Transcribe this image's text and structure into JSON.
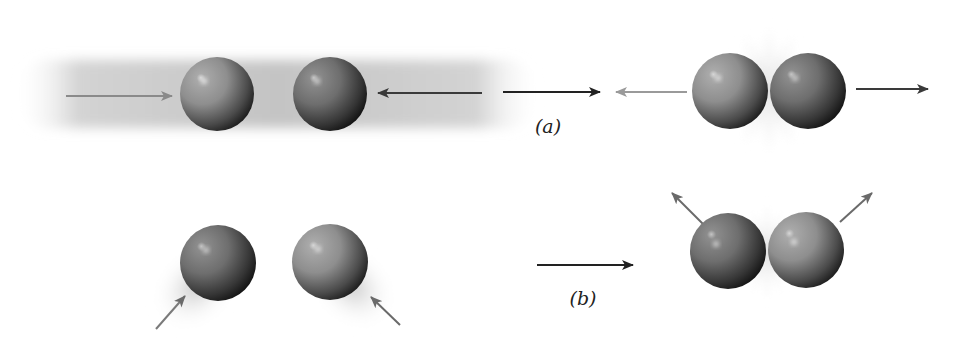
{
  "figure": {
    "panels": [
      {
        "id": "a",
        "label": "(a)",
        "label_pos": [
          548,
          126
        ],
        "description": "Head-on collision: two spheres approach along a line, collide, and move apart along the same line",
        "before": {
          "blur": {
            "x": 15,
            "y": 57,
            "w": 525,
            "h": 74
          },
          "spheres": [
            {
              "cx": 217,
              "cy": 94,
              "r": 37,
              "tone": "light"
            },
            {
              "cx": 330,
              "cy": 94,
              "r": 37,
              "tone": "dark"
            }
          ],
          "arrows": [
            {
              "x1": 66,
              "y1": 96,
              "x2": 172,
              "y2": 96,
              "color": "#8a8a8a",
              "name": "sphere-1-velocity-arrow"
            },
            {
              "x1": 482,
              "y1": 93,
              "x2": 378,
              "y2": 93,
              "color": "#3a3a3a",
              "name": "sphere-2-velocity-arrow"
            }
          ]
        },
        "transition_arrow": {
          "x1": 503,
          "y1": 92,
          "x2": 600,
          "y2": 92,
          "color": "#222222"
        },
        "after": {
          "flash": {
            "cx": 769,
            "cy": 90,
            "r": 72
          },
          "spheres": [
            {
              "cx": 730,
              "cy": 91,
              "r": 38,
              "tone": "light"
            },
            {
              "cx": 808,
              "cy": 91,
              "r": 38,
              "tone": "dark"
            }
          ],
          "arrows": [
            {
              "x1": 687,
              "y1": 92,
              "x2": 616,
              "y2": 92,
              "color": "#9a9a9a",
              "name": "sphere-1-rebound-arrow"
            },
            {
              "x1": 856,
              "y1": 89,
              "x2": 928,
              "y2": 89,
              "color": "#3a3a3a",
              "name": "sphere-2-rebound-arrow"
            }
          ]
        }
      },
      {
        "id": "b",
        "label": "(b)",
        "label_pos": [
          583,
          298
        ],
        "description": "Glancing collision: two spheres approach at angles, collide, and scatter at angles",
        "before": {
          "spheres": [
            {
              "cx": 218,
              "cy": 263,
              "r": 38,
              "tone": "dark",
              "blur_dx": -22,
              "blur_dy": 24
            },
            {
              "cx": 330,
              "cy": 262,
              "r": 38,
              "tone": "light",
              "blur_dx": 22,
              "blur_dy": 24
            }
          ],
          "arrows": [
            {
              "x1": 156,
              "y1": 329,
              "x2": 185,
              "y2": 296,
              "color": "#7a7a7a",
              "name": "sphere-1-velocity-arrow"
            },
            {
              "x1": 400,
              "y1": 325,
              "x2": 371,
              "y2": 297,
              "color": "#6a6a6a",
              "name": "sphere-2-velocity-arrow"
            }
          ]
        },
        "transition_arrow": {
          "x1": 537,
          "y1": 265,
          "x2": 633,
          "y2": 265,
          "color": "#222222"
        },
        "after": {
          "flash": {
            "cx": 767,
            "cy": 252,
            "r": 55
          },
          "spheres": [
            {
              "cx": 728,
              "cy": 251,
              "r": 38,
              "tone": "dark"
            },
            {
              "cx": 806,
              "cy": 250,
              "r": 38,
              "tone": "light"
            }
          ],
          "arrows": [
            {
              "x1": 703,
              "y1": 224,
              "x2": 672,
              "y2": 193,
              "color": "#6a6a6a",
              "name": "sphere-1-scatter-arrow"
            },
            {
              "x1": 840,
              "y1": 222,
              "x2": 872,
              "y2": 193,
              "color": "#6a6a6a",
              "name": "sphere-2-scatter-arrow"
            }
          ]
        }
      }
    ],
    "colors": {
      "sphere_light_mid": "#8e8e8e",
      "sphere_dark_mid": "#6e6e6e",
      "sphere_shadow": "#1a1a1a",
      "highlight": "#d8d8d8",
      "blur": "#b8b8b8",
      "flash": "#c8c8c8"
    }
  }
}
